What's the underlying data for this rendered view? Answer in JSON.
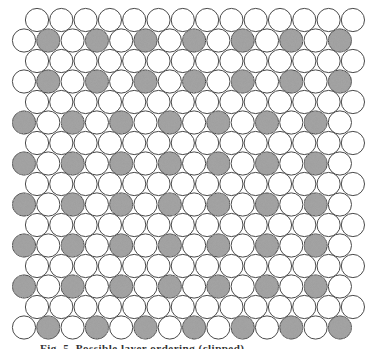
{
  "figure": {
    "circle_radius": 11.6,
    "h_pitch": 24.3,
    "row_pitch": 20.5,
    "first_row_cy": 20,
    "even_row_start_cx": 37,
    "odd_row_start_cx": 24,
    "circles_per_row": 14,
    "colors": {
      "outline": "#4a4a4a",
      "white_fill": "#ffffff",
      "shaded_fill": "#a3a3a3",
      "background": "#ffffff"
    },
    "rows": [
      {
        "index": 0,
        "shaded": []
      },
      {
        "index": 1,
        "shaded": [
          1,
          3,
          5,
          7,
          9,
          11,
          13
        ]
      },
      {
        "index": 2,
        "shaded": []
      },
      {
        "index": 3,
        "shaded": [
          1,
          3,
          5,
          7,
          9,
          11,
          13
        ]
      },
      {
        "index": 4,
        "shaded": []
      },
      {
        "index": 5,
        "shaded": [
          0,
          2,
          4,
          6,
          8,
          10,
          12
        ]
      },
      {
        "index": 6,
        "shaded": []
      },
      {
        "index": 7,
        "shaded": [
          0,
          2,
          4,
          6,
          8,
          10,
          12
        ]
      },
      {
        "index": 8,
        "shaded": []
      },
      {
        "index": 9,
        "shaded": [
          0,
          2,
          4,
          6,
          8,
          10,
          12
        ]
      },
      {
        "index": 10,
        "shaded": []
      },
      {
        "index": 11,
        "shaded": [
          0,
          2,
          4,
          6,
          8,
          10,
          12
        ]
      },
      {
        "index": 12,
        "shaded": []
      },
      {
        "index": 13,
        "shaded": [
          0,
          2,
          4,
          6,
          8,
          10,
          12
        ]
      },
      {
        "index": 14,
        "shaded": []
      },
      {
        "index": 15,
        "shaded": [
          1,
          3,
          5,
          7,
          9,
          11,
          13
        ]
      }
    ]
  },
  "caption": {
    "text": "Fig. 5. Possible layer ordering (clipped)"
  }
}
